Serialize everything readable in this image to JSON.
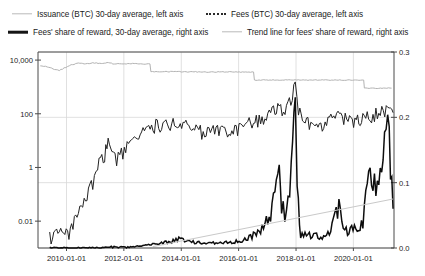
{
  "legend": {
    "items": [
      {
        "label": "Issuance (BTC) 30-day average, left axis",
        "style": "solid-light",
        "color": "#b3b3b3",
        "name": "legend-issuance"
      },
      {
        "label": "Fees (BTC) 30-day average, left axis",
        "style": "dotted",
        "color": "#2a2a2a",
        "name": "legend-fees"
      },
      {
        "label": "Fees' share of reward, 30-day average, right axis",
        "style": "solid-bold",
        "color": "#0d0d0d",
        "name": "legend-fees-share"
      },
      {
        "label": "Trend line for fees' share of reward, right axis",
        "style": "solid-light",
        "color": "#c9c9c9",
        "name": "legend-trend"
      }
    ]
  },
  "chart_data": {
    "type": "line",
    "title": "",
    "xlabel": "",
    "ylabel": "",
    "grid": true,
    "legend_position": "top",
    "x_axis": {
      "type": "date",
      "ticks": [
        "2010-01-01",
        "2012-01-01",
        "2014-01-01",
        "2016-01-01",
        "2018-01-01",
        "2020-01-01"
      ],
      "range": [
        "2009-01-03",
        "2021-06-01"
      ]
    },
    "y_left": {
      "scale": "log",
      "ticks": [
        "10,000",
        "100",
        "1",
        "0.01"
      ],
      "tick_values": [
        10000,
        100,
        1,
        0.01
      ],
      "range": [
        0.001,
        20000
      ],
      "label": "BTC per day (30-day average)"
    },
    "y_right": {
      "scale": "linear",
      "ticks": [
        "0.0",
        "0.1",
        "0.2",
        "0.3"
      ],
      "tick_values": [
        0.0,
        0.1,
        0.2,
        0.3
      ],
      "range": [
        0.0,
        0.3
      ],
      "label": "Fees' share of reward"
    },
    "series": [
      {
        "name": "Issuance (BTC) 30-day average, left axis",
        "axis": "left",
        "style": "solid-light",
        "color": "#b3b3b3",
        "points": [
          [
            "2009-02-01",
            6200
          ],
          [
            "2009-05-01",
            5600
          ],
          [
            "2009-08-01",
            4500
          ],
          [
            "2009-10-01",
            4100
          ],
          [
            "2009-12-01",
            5000
          ],
          [
            "2010-03-01",
            6600
          ],
          [
            "2010-06-01",
            7600
          ],
          [
            "2010-09-01",
            7300
          ],
          [
            "2010-12-01",
            7900
          ],
          [
            "2011-03-01",
            7500
          ],
          [
            "2011-06-01",
            8100
          ],
          [
            "2011-09-01",
            7200
          ],
          [
            "2011-12-01",
            7400
          ],
          [
            "2012-06-01",
            7300
          ],
          [
            "2012-11-28",
            7200
          ],
          [
            "2012-12-10",
            3650
          ],
          [
            "2013-06-01",
            3700
          ],
          [
            "2014-01-01",
            3650
          ],
          [
            "2015-01-01",
            3620
          ],
          [
            "2016-06-01",
            3600
          ],
          [
            "2016-07-09",
            3600
          ],
          [
            "2016-07-20",
            1820
          ],
          [
            "2017-06-01",
            1800
          ],
          [
            "2018-06-01",
            1810
          ],
          [
            "2019-06-01",
            1800
          ],
          [
            "2020-05-11",
            1800
          ],
          [
            "2020-05-20",
            900
          ],
          [
            "2021-05-01",
            900
          ]
        ]
      },
      {
        "name": "Fees (BTC) 30-day average, left axis",
        "axis": "left",
        "style": "dotted",
        "color": "#222222",
        "points": [
          [
            "2009-06-01",
            0.003
          ],
          [
            "2010-02-01",
            0.004
          ],
          [
            "2010-06-01",
            0.02
          ],
          [
            "2010-09-01",
            0.06
          ],
          [
            "2010-12-01",
            0.3
          ],
          [
            "2011-02-01",
            1.2
          ],
          [
            "2011-05-01",
            3.5
          ],
          [
            "2011-06-15",
            9.0
          ],
          [
            "2011-08-01",
            3.0
          ],
          [
            "2011-10-01",
            2.0
          ],
          [
            "2011-12-01",
            4.0
          ],
          [
            "2012-03-01",
            7.0
          ],
          [
            "2012-06-01",
            10.0
          ],
          [
            "2012-09-01",
            20.0
          ],
          [
            "2012-12-01",
            30.0
          ],
          [
            "2013-03-01",
            45.0
          ],
          [
            "2013-06-01",
            38.0
          ],
          [
            "2013-09-01",
            42.0
          ],
          [
            "2013-12-01",
            55.0
          ],
          [
            "2014-03-01",
            38.0
          ],
          [
            "2014-06-01",
            27.0
          ],
          [
            "2014-12-01",
            23.0
          ],
          [
            "2015-06-01",
            25.0
          ],
          [
            "2015-12-01",
            32.0
          ],
          [
            "2016-06-01",
            50.0
          ],
          [
            "2016-12-01",
            75.0
          ],
          [
            "2017-06-01",
            190.0
          ],
          [
            "2017-09-01",
            140.0
          ],
          [
            "2017-12-22",
            1400.0
          ],
          [
            "2018-02-01",
            150.0
          ],
          [
            "2018-06-01",
            50.0
          ],
          [
            "2018-12-01",
            40.0
          ],
          [
            "2019-06-01",
            90.0
          ],
          [
            "2019-12-01",
            60.0
          ],
          [
            "2020-05-01",
            80.0
          ],
          [
            "2020-11-01",
            110.0
          ],
          [
            "2021-04-01",
            170.0
          ],
          [
            "2021-05-20",
            110.0
          ]
        ]
      },
      {
        "name": "Fees' share of reward, 30-day average, right axis",
        "axis": "right",
        "style": "solid-bold",
        "color": "#0d0d0d",
        "points": [
          [
            "2009-06-01",
            0.0
          ],
          [
            "2010-06-01",
            0.0
          ],
          [
            "2011-01-01",
            0.0005
          ],
          [
            "2011-06-01",
            0.0015
          ],
          [
            "2012-01-01",
            0.001
          ],
          [
            "2012-06-01",
            0.002
          ],
          [
            "2013-01-01",
            0.006
          ],
          [
            "2013-06-01",
            0.008
          ],
          [
            "2013-12-01",
            0.013
          ],
          [
            "2014-06-01",
            0.009
          ],
          [
            "2014-12-01",
            0.007
          ],
          [
            "2015-06-01",
            0.008
          ],
          [
            "2015-12-01",
            0.01
          ],
          [
            "2016-06-01",
            0.016
          ],
          [
            "2016-12-01",
            0.035
          ],
          [
            "2017-03-01",
            0.055
          ],
          [
            "2017-06-01",
            0.105
          ],
          [
            "2017-07-01",
            0.06
          ],
          [
            "2017-09-01",
            0.05
          ],
          [
            "2017-11-01",
            0.12
          ],
          [
            "2017-12-22",
            0.29
          ],
          [
            "2018-01-15",
            0.1
          ],
          [
            "2018-03-01",
            0.02
          ],
          [
            "2018-09-01",
            0.018
          ],
          [
            "2019-03-01",
            0.02
          ],
          [
            "2019-07-01",
            0.06
          ],
          [
            "2019-10-01",
            0.025
          ],
          [
            "2020-02-01",
            0.03
          ],
          [
            "2020-05-01",
            0.035
          ],
          [
            "2020-08-01",
            0.12
          ],
          [
            "2020-11-01",
            0.08
          ],
          [
            "2021-02-01",
            0.15
          ],
          [
            "2021-04-01",
            0.175
          ],
          [
            "2021-05-20",
            0.06
          ]
        ]
      },
      {
        "name": "Trend line for fees' share of reward, right axis",
        "axis": "right",
        "style": "solid-light",
        "color": "#c9c9c9",
        "points": [
          [
            "2013-01-01",
            0.002
          ],
          [
            "2021-05-20",
            0.075
          ]
        ]
      }
    ]
  }
}
